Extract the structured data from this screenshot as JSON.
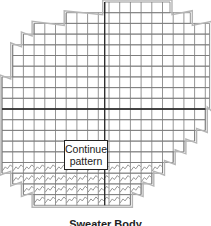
{
  "diagram": {
    "caption": "Sweater Body",
    "note": {
      "line1": "Continue",
      "line2": "pattern"
    },
    "colors": {
      "grid": "#7a7a7a",
      "axis": "#222222",
      "outline": "#b5b5b5",
      "stitch": "#8a8a8a",
      "background": "#ffffff"
    },
    "grid": {
      "cell": 10.7,
      "origin_x": 2,
      "origin_y": 2,
      "columns": 19,
      "center_col": 9.6,
      "axis_row": 10
    },
    "rows": [
      {
        "row": 0,
        "from": 9.6,
        "to": 15.7
      },
      {
        "row": 1,
        "from": 6.0,
        "to": 17.6
      },
      {
        "row": 2,
        "from": 3.0,
        "to": 19.4
      },
      {
        "row": 3,
        "from": 2.0,
        "to": 19.4
      },
      {
        "row": 4,
        "from": 1.0,
        "to": 19.4
      },
      {
        "row": 5,
        "from": 1.0,
        "to": 19.4
      },
      {
        "row": 6,
        "from": 1.0,
        "to": 19.4
      },
      {
        "row": 7,
        "from": 0.0,
        "to": 19.4
      },
      {
        "row": 8,
        "from": 0.0,
        "to": 19.4
      },
      {
        "row": 9,
        "from": 0.0,
        "to": 19.4
      },
      {
        "row": 10,
        "from": 0.0,
        "to": 19.0
      },
      {
        "row": 11,
        "from": 0.0,
        "to": 19.0
      },
      {
        "row": 12,
        "from": 0.0,
        "to": 18.0
      },
      {
        "row": 13,
        "from": 0.0,
        "to": 17.0
      },
      {
        "row": 14,
        "from": 0.0,
        "to": 16.0
      },
      {
        "row": 15,
        "from": 0.0,
        "to": 15.0
      },
      {
        "row": 16,
        "from": 1.0,
        "to": 14.0
      },
      {
        "row": 17,
        "from": 2.0,
        "to": 13.0
      },
      {
        "row": 18,
        "from": 3.0,
        "to": 12.0
      }
    ],
    "stitch_rows": [
      15,
      16,
      17,
      18
    ]
  }
}
